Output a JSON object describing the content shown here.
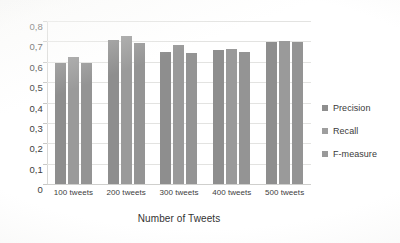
{
  "chart_data": {
    "type": "bar",
    "title": "",
    "xlabel": "Number of Tweets",
    "ylabel": "",
    "categories": [
      "100 tweets",
      "200 tweets",
      "300 tweets",
      "400 tweets",
      "500 tweets"
    ],
    "series": [
      {
        "name": "Precision",
        "values": [
          0.6,
          0.71,
          0.655,
          0.665,
          0.7
        ],
        "color": "#8e8e8e"
      },
      {
        "name": "Recall",
        "values": [
          0.63,
          0.73,
          0.685,
          0.67,
          0.705
        ],
        "color": "#9a9a9a"
      },
      {
        "name": "F-measure",
        "values": [
          0.6,
          0.695,
          0.65,
          0.655,
          0.7
        ],
        "color": "#949494"
      }
    ],
    "ylim": [
      0,
      0.8
    ],
    "ytick_values": [
      0,
      0.1,
      0.2,
      0.3,
      0.4,
      0.5,
      0.6,
      0.7,
      0.8
    ],
    "ytick_labels": [
      "0",
      "0,1",
      "0,2",
      "0,3",
      "0,4",
      "0,5",
      "0,6",
      "0,7",
      "0,8"
    ],
    "decimal_separator": ",",
    "grid": "horizontal",
    "legend_position": "right",
    "legend_entries": [
      "Precision",
      "Recall",
      "F-measure"
    ]
  },
  "axis": {
    "x_title": "Number of Tweets"
  },
  "legend": {
    "items": [
      {
        "label": "Precision"
      },
      {
        "label": "Recall"
      },
      {
        "label": "F-measure"
      }
    ]
  },
  "colors": {
    "precision": "#8e8e8e",
    "recall": "#9a9a9a",
    "fmeasure": "#949494",
    "gridline": "#e3e3e1",
    "text": "#3d3d3d",
    "background": "#ffffff"
  }
}
